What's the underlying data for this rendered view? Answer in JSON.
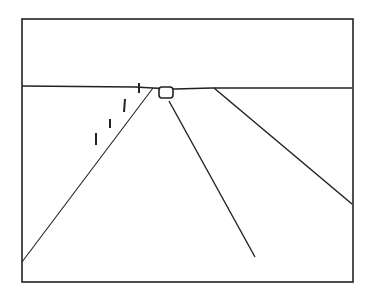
{
  "figure": {
    "stroke_color": "#222222",
    "background_color": "#ffffff",
    "frame": {
      "x1": 22,
      "y1": 19,
      "x2": 353,
      "y2": 282
    },
    "horizon": {
      "points": "22,86 135,87 153,88 175,89 212,88 352,88"
    },
    "road_left_edge": {
      "x1": 153,
      "y1": 88,
      "x2": 22,
      "y2": 262
    },
    "road_center_line": {
      "x1": 169,
      "y1": 101,
      "x2": 255,
      "y2": 257
    },
    "road_right_edge": {
      "x1": 214,
      "y1": 88,
      "x2": 352,
      "y2": 204
    },
    "vehicle": {
      "x": 159,
      "y": 87,
      "width": 14,
      "height": 11,
      "rx": 3
    },
    "posts": [
      {
        "x1": 139,
        "y1": 83,
        "x2": 139,
        "y2": 93
      },
      {
        "x1": 125,
        "y1": 99,
        "x2": 124,
        "y2": 112
      },
      {
        "x1": 110,
        "y1": 119,
        "x2": 110,
        "y2": 128
      },
      {
        "x1": 96,
        "y1": 133,
        "x2": 96,
        "y2": 145
      }
    ]
  }
}
